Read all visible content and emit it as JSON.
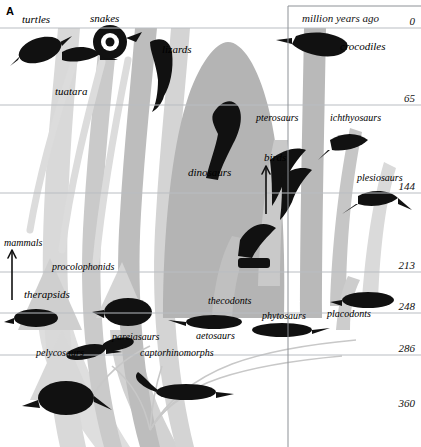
{
  "figure": {
    "panel_label": "A",
    "axis_title": "million years ago",
    "axis_unit_note": "million years ago"
  },
  "axis": {
    "orientation": "vertical",
    "title": "million years ago",
    "ticks": [
      {
        "value": "0",
        "y": 28
      },
      {
        "value": "65",
        "y": 105
      },
      {
        "value": "144",
        "y": 193
      },
      {
        "value": "213",
        "y": 272
      },
      {
        "value": "248",
        "y": 313
      },
      {
        "value": "286",
        "y": 355
      },
      {
        "value": "360",
        "y": 410
      }
    ],
    "gridline_color": "#b9bdc2",
    "divider_x": 288
  },
  "taxa": [
    {
      "name": "turtles",
      "x": 22,
      "y": 14,
      "size": "sz11"
    },
    {
      "name": "snakes",
      "x": 90,
      "y": 13,
      "size": "sz11"
    },
    {
      "name": "lizards",
      "x": 162,
      "y": 44,
      "size": "sz11"
    },
    {
      "name": "tuatara",
      "x": 55,
      "y": 86,
      "size": "sz11"
    },
    {
      "name": "crocodiles",
      "x": 340,
      "y": 41,
      "size": "sz11"
    },
    {
      "name": "pterosaurs",
      "x": 256,
      "y": 113,
      "size": "sz10"
    },
    {
      "name": "ichthyosaurs",
      "x": 330,
      "y": 113,
      "size": "sz10"
    },
    {
      "name": "dinosaurs",
      "x": 188,
      "y": 167,
      "size": "sz11"
    },
    {
      "name": "birds",
      "x": 264,
      "y": 152,
      "size": "sz11"
    },
    {
      "name": "plesiosaurs",
      "x": 357,
      "y": 173,
      "size": "sz10"
    },
    {
      "name": "mammals",
      "x": 4,
      "y": 238,
      "size": "sz10"
    },
    {
      "name": "procolophonids",
      "x": 52,
      "y": 262,
      "size": "sz10"
    },
    {
      "name": "therapsids",
      "x": 24,
      "y": 289,
      "size": "sz11"
    },
    {
      "name": "thecodonts",
      "x": 208,
      "y": 296,
      "size": "sz10"
    },
    {
      "name": "phytosaurs",
      "x": 262,
      "y": 311,
      "size": "sz10"
    },
    {
      "name": "placodonts",
      "x": 327,
      "y": 309,
      "size": "sz10"
    },
    {
      "name": "pareiasaurs",
      "x": 112,
      "y": 332,
      "size": "sz10"
    },
    {
      "name": "aetosaurs",
      "x": 196,
      "y": 331,
      "size": "sz10"
    },
    {
      "name": "pelycosaurs",
      "x": 36,
      "y": 348,
      "size": "sz10"
    },
    {
      "name": "captorhinomorphs",
      "x": 140,
      "y": 348,
      "size": "sz10"
    }
  ],
  "colors": {
    "band_light": "#dcdcdc",
    "band_mid": "#c2c2c2",
    "band_dark": "#a6a6a6",
    "silhouette": "#101010",
    "gridline": "#b9bdc2",
    "text": "#0a0a0a",
    "background": "#ffffff"
  },
  "chart_data": {
    "type": "area",
    "xlabel": "",
    "ylabel": "million years ago",
    "ylim": [
      0,
      360
    ],
    "y_inverted": false,
    "gridlines": [
      0,
      65,
      144,
      213,
      248,
      286,
      360
    ],
    "tick_labels": [
      "0",
      "65",
      "144",
      "213",
      "248",
      "286",
      "360"
    ],
    "legend": "none",
    "grid": true,
    "series": [
      {
        "name": "turtles",
        "range_mya": [
          0,
          210
        ],
        "status": "extant"
      },
      {
        "name": "snakes",
        "range_mya": [
          0,
          150
        ],
        "status": "extant"
      },
      {
        "name": "lizards",
        "range_mya": [
          0,
          200
        ],
        "status": "extant"
      },
      {
        "name": "tuatara",
        "range_mya": [
          0,
          230
        ],
        "status": "extant"
      },
      {
        "name": "crocodiles",
        "range_mya": [
          0,
          230
        ],
        "status": "extant"
      },
      {
        "name": "birds",
        "range_mya": [
          0,
          150
        ],
        "status": "extant"
      },
      {
        "name": "mammals",
        "range_mya": [
          0,
          220
        ],
        "status": "extant"
      },
      {
        "name": "pterosaurs",
        "range_mya": [
          65,
          215
        ],
        "status": "extinct"
      },
      {
        "name": "ichthyosaurs",
        "range_mya": [
          90,
          245
        ],
        "status": "extinct"
      },
      {
        "name": "plesiosaurs",
        "range_mya": [
          65,
          215
        ],
        "status": "extinct"
      },
      {
        "name": "dinosaurs",
        "range_mya": [
          65,
          230
        ],
        "status": "extinct"
      },
      {
        "name": "placodonts",
        "range_mya": [
          210,
          245
        ],
        "status": "extinct"
      },
      {
        "name": "phytosaurs",
        "range_mya": [
          205,
          240
        ],
        "status": "extinct"
      },
      {
        "name": "aetosaurs",
        "range_mya": [
          200,
          235
        ],
        "status": "extinct"
      },
      {
        "name": "thecodonts",
        "range_mya": [
          205,
          250
        ],
        "status": "extinct"
      },
      {
        "name": "therapsids",
        "range_mya": [
          200,
          285
        ],
        "status": "extinct"
      },
      {
        "name": "pelycosaurs",
        "range_mya": [
          255,
          320
        ],
        "status": "extinct"
      },
      {
        "name": "pareiasaurs",
        "range_mya": [
          240,
          275
        ],
        "status": "extinct"
      },
      {
        "name": "procolophonids",
        "range_mya": [
          205,
          265
        ],
        "status": "extinct"
      },
      {
        "name": "captorhinomorphs",
        "range_mya": [
          260,
          320
        ],
        "status": "extinct"
      }
    ]
  }
}
